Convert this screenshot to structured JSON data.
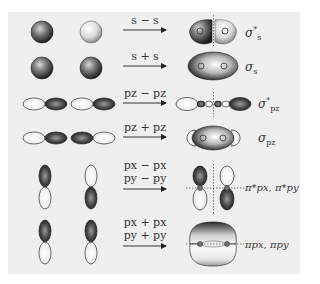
{
  "rows": [
    {
      "combination": "s − s",
      "lines": [
        "s − s"
      ],
      "result": {
        "symbol": "σ",
        "sub": "s",
        "sup": "*"
      },
      "type": "antibonding"
    },
    {
      "combination": "s + s",
      "lines": [
        "s + s"
      ],
      "result": {
        "symbol": "σ",
        "sub": "s",
        "sup": ""
      },
      "type": "bonding"
    },
    {
      "combination": "pz − pz",
      "lines": [
        "pz − pz"
      ],
      "result": {
        "symbol": "σ",
        "sub": "pz",
        "sup": "*"
      },
      "type": "antibonding"
    },
    {
      "combination": "pz + pz",
      "lines": [
        "pz + pz"
      ],
      "result": {
        "symbol": "σ",
        "sub": "pz",
        "sup": ""
      },
      "type": "bonding"
    },
    {
      "combination": "px − px / py − py",
      "lines": [
        "px − px",
        "py − py"
      ],
      "result": {
        "text": "π*px, π*py"
      },
      "type": "antibonding"
    },
    {
      "combination": "px + px / py + py",
      "lines": [
        "px + px",
        "py + py"
      ],
      "result": {
        "text": "πpx, πpy"
      },
      "type": "bonding"
    }
  ],
  "labels": {
    "r0": "s − s",
    "r1": "s + s",
    "r2": "pz − pz",
    "r3": "pz + pz",
    "r4a": "px − px",
    "r4b": "py − py",
    "r5a": "px + px",
    "r5b": "py + py"
  },
  "colors": {
    "background": "#efefef",
    "dark_lobe": "#3a3a3a",
    "light_lobe": "#f4f4f4",
    "line": "#333333"
  }
}
